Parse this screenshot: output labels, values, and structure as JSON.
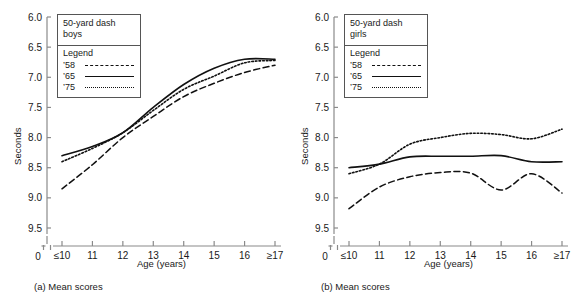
{
  "figure": {
    "panels": [
      {
        "id": "a",
        "caption": "(a) Mean scores",
        "legend": {
          "title_line1": "50-yard dash",
          "title_line2": "boys",
          "head": "Legend",
          "entries": [
            {
              "key": "’58",
              "style": "dashed"
            },
            {
              "key": "’65",
              "style": "solid"
            },
            {
              "key": "’75",
              "style": "dotted"
            }
          ]
        },
        "chart_data": {
          "type": "line",
          "title": "50-yard dash boys",
          "xlabel": "Age (years)",
          "ylabel": "Seconds",
          "categories": [
            "≤10",
            "11",
            "12",
            "13",
            "14",
            "15",
            "16",
            "≥17"
          ],
          "yticks": [
            "6.0",
            "6.5",
            "7.0",
            "7.5",
            "8.0",
            "8.5",
            "9.0",
            "9.5"
          ],
          "ytick_values": [
            6.0,
            6.5,
            7.0,
            7.5,
            8.0,
            8.5,
            9.0,
            9.5
          ],
          "ylim": [
            6.0,
            9.5
          ],
          "y_inverted": true,
          "axis_break_label": "0",
          "grid": false,
          "legend_position": "upper-left-inside",
          "series": [
            {
              "name": "’58",
              "style": "dashed",
              "values": [
                8.85,
                8.45,
                8.0,
                7.65,
                7.32,
                7.1,
                6.92,
                6.8
              ]
            },
            {
              "name": "’65",
              "style": "solid",
              "values": [
                8.3,
                8.15,
                7.92,
                7.5,
                7.12,
                6.85,
                6.7,
                6.7
              ]
            },
            {
              "name": "’75",
              "style": "dotted",
              "values": [
                8.4,
                8.18,
                7.92,
                7.55,
                7.2,
                6.98,
                6.76,
                6.72
              ]
            }
          ]
        }
      },
      {
        "id": "b",
        "caption": "(b) Mean scores",
        "legend": {
          "title_line1": "50-yard dash",
          "title_line2": "girls",
          "head": "Legend",
          "entries": [
            {
              "key": "’58",
              "style": "dashed"
            },
            {
              "key": "’65",
              "style": "solid"
            },
            {
              "key": "’75",
              "style": "dotted"
            }
          ]
        },
        "chart_data": {
          "type": "line",
          "title": "50-yard dash girls",
          "xlabel": "Age (years)",
          "ylabel": "Seconds",
          "categories": [
            "≤10",
            "11",
            "12",
            "13",
            "14",
            "15",
            "16",
            "≥17"
          ],
          "yticks": [
            "6.0",
            "6.5",
            "7.0",
            "7.5",
            "8.0",
            "8.5",
            "9.0",
            "9.5"
          ],
          "ytick_values": [
            6.0,
            6.5,
            7.0,
            7.5,
            8.0,
            8.5,
            9.0,
            9.5
          ],
          "ylim": [
            6.0,
            9.5
          ],
          "y_inverted": true,
          "axis_break_label": "0",
          "grid": false,
          "legend_position": "upper-left-inside",
          "series": [
            {
              "name": "’58",
              "style": "dashed",
              "values": [
                9.18,
                8.82,
                8.65,
                8.58,
                8.59,
                8.87,
                8.6,
                8.92
              ]
            },
            {
              "name": "’65",
              "style": "solid",
              "values": [
                8.5,
                8.44,
                8.32,
                8.31,
                8.31,
                8.3,
                8.4,
                8.4
              ]
            },
            {
              "name": "’75",
              "style": "dotted",
              "values": [
                8.6,
                8.44,
                8.11,
                8.0,
                7.93,
                7.95,
                8.02,
                7.86
              ]
            }
          ]
        }
      }
    ]
  }
}
